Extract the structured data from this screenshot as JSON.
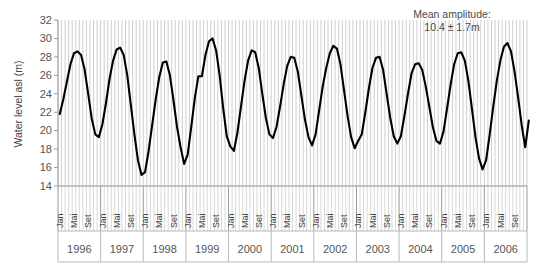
{
  "figure": {
    "background_color": "#ffffff",
    "line_color": "#000000",
    "axis_color": "#9a9a9a",
    "grid_color": "#cfcfcf"
  },
  "annotation": {
    "line1": "Mean amplitude:",
    "line2": "10.4 ± 1.7m"
  },
  "axis": {
    "y_label": "Water level asl (m)",
    "y_ticks": [
      "32",
      "30",
      "28",
      "26",
      "24",
      "22",
      "20",
      "18",
      "16",
      "14"
    ],
    "month_tick_labels": [
      "Jan",
      "Mai",
      "Set"
    ],
    "year_labels": [
      "1996",
      "1997",
      "1998",
      "1999",
      "2000",
      "2001",
      "2002",
      "2003",
      "2004",
      "2005",
      "2006"
    ]
  },
  "chart_data": {
    "type": "line",
    "title": "",
    "xlabel": "",
    "ylabel": "Water level asl (m)",
    "ylim": [
      14,
      32
    ],
    "ytick_step": 2,
    "grid": true,
    "legend": "none",
    "annotations": [
      {
        "text": "Mean amplitude: 10.4 ± 1.7m",
        "mean_amplitude_m": 10.4,
        "amplitude_sd_m": 1.7
      }
    ],
    "x_axis": {
      "type": "monthly",
      "start": "1996-01",
      "end": "2006-12",
      "year_labels": [
        "1996",
        "1997",
        "1998",
        "1999",
        "2000",
        "2001",
        "2002",
        "2003",
        "2004",
        "2005",
        "2006"
      ],
      "month_labels_shown": [
        "Jan",
        "Mai",
        "Set"
      ],
      "month_label_positions": [
        1,
        5,
        9
      ]
    },
    "series": [
      {
        "name": "Water level asl (m)",
        "units": "m",
        "x": [
          "1996-01",
          "1996-02",
          "1996-03",
          "1996-04",
          "1996-05",
          "1996-06",
          "1996-07",
          "1996-08",
          "1996-09",
          "1996-10",
          "1996-11",
          "1996-12",
          "1997-01",
          "1997-02",
          "1997-03",
          "1997-04",
          "1997-05",
          "1997-06",
          "1997-07",
          "1997-08",
          "1997-09",
          "1997-10",
          "1997-11",
          "1997-12",
          "1998-01",
          "1998-02",
          "1998-03",
          "1998-04",
          "1998-05",
          "1998-06",
          "1998-07",
          "1998-08",
          "1998-09",
          "1998-10",
          "1998-11",
          "1998-12",
          "1999-01",
          "1999-02",
          "1999-03",
          "1999-04",
          "1999-05",
          "1999-06",
          "1999-07",
          "1999-08",
          "1999-09",
          "1999-10",
          "1999-11",
          "1999-12",
          "2000-01",
          "2000-02",
          "2000-03",
          "2000-04",
          "2000-05",
          "2000-06",
          "2000-07",
          "2000-08",
          "2000-09",
          "2000-10",
          "2000-11",
          "2000-12",
          "2001-01",
          "2001-02",
          "2001-03",
          "2001-04",
          "2001-05",
          "2001-06",
          "2001-07",
          "2001-08",
          "2001-09",
          "2001-10",
          "2001-11",
          "2001-12",
          "2002-01",
          "2002-02",
          "2002-03",
          "2002-04",
          "2002-05",
          "2002-06",
          "2002-07",
          "2002-08",
          "2002-09",
          "2002-10",
          "2002-11",
          "2002-12",
          "2003-01",
          "2003-02",
          "2003-03",
          "2003-04",
          "2003-05",
          "2003-06",
          "2003-07",
          "2003-08",
          "2003-09",
          "2003-10",
          "2003-11",
          "2003-12",
          "2004-01",
          "2004-02",
          "2004-03",
          "2004-04",
          "2004-05",
          "2004-06",
          "2004-07",
          "2004-08",
          "2004-09",
          "2004-10",
          "2004-11",
          "2004-12",
          "2005-01",
          "2005-02",
          "2005-03",
          "2005-04",
          "2005-05",
          "2005-06",
          "2005-07",
          "2005-08",
          "2005-09",
          "2005-10",
          "2005-11",
          "2005-12",
          "2006-01",
          "2006-02",
          "2006-03",
          "2006-04",
          "2006-05",
          "2006-06",
          "2006-07",
          "2006-08",
          "2006-09",
          "2006-10",
          "2006-11",
          "2006-12"
        ],
        "values": [
          21.8,
          23.4,
          25.3,
          27.2,
          28.4,
          28.6,
          28.2,
          26.6,
          24.0,
          21.3,
          19.6,
          19.3,
          20.7,
          23.0,
          25.6,
          27.6,
          28.8,
          29.0,
          28.2,
          26.0,
          22.8,
          19.6,
          16.8,
          15.2,
          15.5,
          17.8,
          20.6,
          23.4,
          25.8,
          27.4,
          27.5,
          26.0,
          23.3,
          20.4,
          18.2,
          16.4,
          17.4,
          20.4,
          23.5,
          25.9,
          25.9,
          28.2,
          29.7,
          30.0,
          28.7,
          26.0,
          22.4,
          19.4,
          18.3,
          17.8,
          19.8,
          22.6,
          25.4,
          27.6,
          28.7,
          28.5,
          26.8,
          24.0,
          21.4,
          19.6,
          19.2,
          20.4,
          22.6,
          25.0,
          27.0,
          28.0,
          27.9,
          26.4,
          23.8,
          21.2,
          19.3,
          18.4,
          19.6,
          22.2,
          24.8,
          26.8,
          28.4,
          29.2,
          28.9,
          27.2,
          24.4,
          21.6,
          19.3,
          18.1,
          18.9,
          19.6,
          22.0,
          24.6,
          26.8,
          27.9,
          28.0,
          26.6,
          24.0,
          21.4,
          19.4,
          18.6,
          19.4,
          21.6,
          24.0,
          26.2,
          27.2,
          27.3,
          26.6,
          24.8,
          22.6,
          20.4,
          18.9,
          18.6,
          19.9,
          22.4,
          25.0,
          27.2,
          28.4,
          28.5,
          27.6,
          25.4,
          22.4,
          19.3,
          17.0,
          15.8,
          16.8,
          19.6,
          22.6,
          25.4,
          27.6,
          29.1,
          29.5,
          28.6,
          26.4,
          23.6,
          20.6,
          18.2
        ],
        "yearly_peaks": [
          28.6,
          29.0,
          27.5,
          30.0,
          28.7,
          28.0,
          29.2,
          28.0,
          27.3,
          28.5,
          29.5
        ],
        "yearly_troughs": [
          19.3,
          15.2,
          16.4,
          19.4,
          17.8,
          18.4,
          18.1,
          18.6,
          18.6,
          15.8,
          18.2
        ],
        "final_value": 21.1
      }
    ]
  }
}
